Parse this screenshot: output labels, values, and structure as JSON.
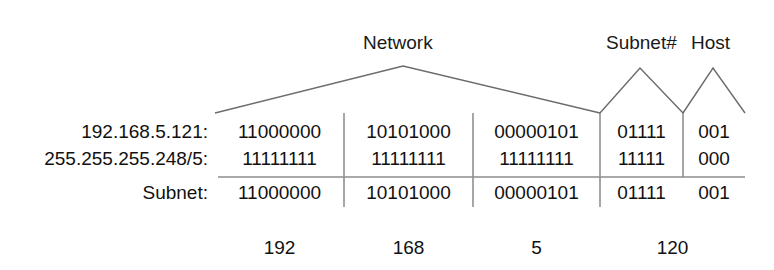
{
  "diagram": {
    "background_color": "#ffffff",
    "line_color": "#6b6b6b",
    "rule_color": "#8c8c8c",
    "text_color": "#111111"
  },
  "brackets": [
    {
      "id": "network",
      "label": "Network"
    },
    {
      "id": "subnet_num",
      "label": "Subnet#"
    },
    {
      "id": "host",
      "label": "Host"
    }
  ],
  "rows": [
    {
      "id": "ip",
      "label": "192.168.5.121:",
      "octet1": "11000000",
      "octet2": "10101000",
      "octet3": "00000101",
      "subnet_bits": "01111",
      "host_bits": "001"
    },
    {
      "id": "mask",
      "label": "255.255.255.248/5:",
      "octet1": "11111111",
      "octet2": "11111111",
      "octet3": "11111111",
      "subnet_bits": "11111",
      "host_bits": "000"
    },
    {
      "id": "subnet",
      "label": "Subnet:",
      "octet1": "11000000",
      "octet2": "10101000",
      "octet3": "00000101",
      "subnet_bits": "01111",
      "host_bits": "001"
    }
  ],
  "decimals": {
    "octet1": "192",
    "octet2": "168",
    "octet3": "5",
    "octet4": "120"
  }
}
